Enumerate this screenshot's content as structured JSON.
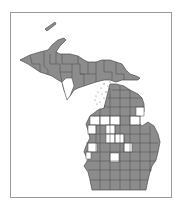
{
  "map": {
    "region": "Michigan",
    "kind": "county distribution map",
    "colors": {
      "present": "#8c8c8c",
      "absent": "#ffffff",
      "county_border": "#4a4a4a",
      "frame": "#9a9a9a",
      "water_dots": "#777777"
    },
    "legend": {
      "present_label": "present",
      "absent_label": "absent"
    }
  }
}
